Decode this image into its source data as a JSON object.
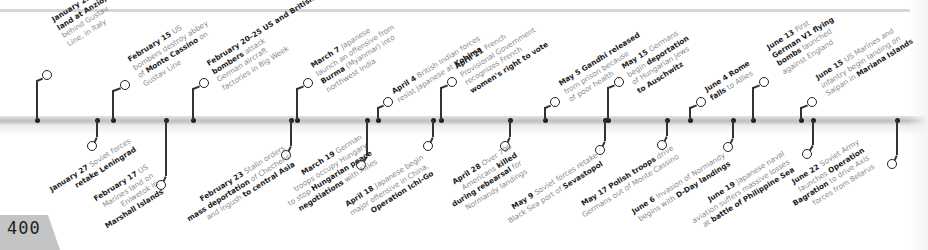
{
  "page_number": "400",
  "colors": {
    "band": "#c8c8c8",
    "marker": "#222222",
    "label_text": "#8a8a8a",
    "bold_text": "#1e1e1e",
    "page_tab": "#c4c4c4"
  },
  "events_top": [
    {
      "date": "January 22",
      "lines": [
        [
          [
            "Allied forces",
            0
          ]
        ],
        [
          [
            "land at Anzio,",
            1
          ]
        ],
        [
          [
            "behind Gustav",
            0
          ]
        ],
        [
          [
            "Line, in Italy",
            0
          ]
        ]
      ],
      "x": 37,
      "ring": [
        42,
        70
      ],
      "label": [
        50,
        16
      ]
    },
    {
      "date": "February 15",
      "lines": [
        [
          [
            "US",
            0
          ]
        ],
        [
          [
            "bombers destroy abbey",
            0
          ]
        ],
        [
          [
            "of ",
            0
          ],
          [
            "Monte Cassino",
            1
          ],
          [
            " on",
            0
          ]
        ],
        [
          [
            "Gustav Line",
            0
          ]
        ]
      ],
      "x": 113,
      "ring": [
        120,
        80
      ],
      "label": [
        126,
        56
      ]
    },
    {
      "date": "February 20–25",
      "lines": [
        [
          [
            "US and British",
            1
          ]
        ],
        [
          [
            "bombers",
            1
          ],
          [
            " attack",
            0
          ]
        ],
        [
          [
            "German aircraft",
            0
          ]
        ],
        [
          [
            "factories in Big Week",
            0
          ]
        ]
      ],
      "x": 193,
      "ring": [
        199,
        78
      ],
      "label": [
        205,
        60
      ]
    },
    {
      "date": "March 7",
      "lines": [
        [
          [
            "Japanese",
            0
          ]
        ],
        [
          [
            "launch an offensive from",
            0
          ]
        ],
        [
          [
            "Burma",
            1
          ],
          [
            " (Myanmar) into",
            0
          ]
        ],
        [
          [
            "northwest India",
            0
          ]
        ]
      ],
      "x": 297,
      "ring": [
        303,
        78
      ],
      "label": [
        309,
        62
      ]
    },
    {
      "date": "April 4",
      "lines": [
        [
          [
            "British Indian forces",
            0
          ]
        ],
        [
          [
            "resist Japanese at ",
            0
          ],
          [
            "Kohima",
            1
          ]
        ]
      ],
      "x": 378,
      "ring": [
        383,
        97
      ],
      "label": [
        390,
        88
      ]
    },
    {
      "date": "April 21",
      "lines": [
        [
          [
            "French",
            0
          ]
        ],
        [
          [
            "Provisional Government",
            0
          ]
        ],
        [
          [
            "recognizes French",
            0
          ]
        ],
        [
          [
            "women's right to vote",
            1
          ]
        ]
      ],
      "x": 441,
      "ring": [
        447,
        77
      ],
      "label": [
        453,
        63
      ]
    },
    {
      "date": "May 5",
      "lines": [
        [
          [
            "Gandhi released",
            1
          ]
        ],
        [
          [
            "from prison because",
            0
          ]
        ],
        [
          [
            "of poor health",
            0
          ]
        ]
      ],
      "x": 545,
      "ring": [
        550,
        97
      ],
      "label": [
        557,
        80
      ]
    },
    {
      "date": "May 15",
      "lines": [
        [
          [
            "Germans",
            0
          ]
        ],
        [
          [
            "begin ",
            0
          ],
          [
            "deportation",
            1
          ]
        ],
        [
          [
            "of Hungarian Jews",
            0
          ]
        ],
        [
          [
            "to Auschwitz",
            1
          ]
        ]
      ],
      "x": 608,
      "ring": [
        614,
        77
      ],
      "label": [
        620,
        63
      ]
    },
    {
      "date": "June 4",
      "lines": [
        [
          [
            "Rome",
            1
          ]
        ],
        [
          [
            "falls",
            1
          ],
          [
            " to Allies",
            0
          ]
        ]
      ],
      "x": 690,
      "ring": [
        696,
        97
      ],
      "label": [
        703,
        86
      ]
    },
    {
      "date": "June 13",
      "lines": [
        [
          [
            "First",
            0
          ]
        ],
        [
          [
            "German V1 flying",
            1
          ]
        ],
        [
          [
            "bombs",
            1
          ],
          [
            " launched",
            0
          ]
        ],
        [
          [
            "against England",
            0
          ]
        ]
      ],
      "x": 753,
      "ring": [
        759,
        77
      ],
      "label": [
        765,
        44
      ]
    },
    {
      "date": "June 15",
      "lines": [
        [
          [
            "US Marines and",
            0
          ]
        ],
        [
          [
            "infantry begin landing on",
            0
          ]
        ],
        [
          [
            "Saipan in ",
            0
          ],
          [
            "Mariana Islands",
            1
          ]
        ]
      ],
      "x": 801,
      "ring": [
        807,
        97
      ],
      "label": [
        814,
        74
      ]
    }
  ],
  "events_bottom": [
    {
      "date": "January 27",
      "lines": [
        [
          [
            "Soviet forces",
            0
          ]
        ],
        [
          [
            "retake Leningrad",
            1
          ]
        ]
      ],
      "x": 97,
      "ring": [
        87,
        141
      ],
      "label": [
        48,
        186
      ]
    },
    {
      "date": "February 17",
      "lines": [
        [
          [
            "US",
            0
          ]
        ],
        [
          [
            "Marines land on",
            0
          ]
        ],
        [
          [
            "Eniwetok in",
            0
          ]
        ],
        [
          [
            "Marshall Islands",
            1
          ]
        ]
      ],
      "x": 166,
      "ring": [
        156,
        180
      ],
      "label": [
        88,
        198
      ]
    },
    {
      "date": "February 23",
      "lines": [
        [
          [
            "Stalin orders",
            0
          ]
        ],
        [
          [
            "mass deportation",
            1
          ],
          [
            " of Chechens",
            0
          ]
        ],
        [
          [
            "and Ingush ",
            0
          ],
          [
            "to central Asia",
            1
          ]
        ]
      ],
      "x": 291,
      "ring": [
        281,
        150
      ],
      "label": [
        180,
        207
      ]
    },
    {
      "date": "March 19",
      "lines": [
        [
          [
            "German",
            0
          ]
        ],
        [
          [
            "troops occupy Hungary",
            0
          ]
        ],
        [
          [
            "to stop ",
            0
          ],
          [
            "Hungarian peace",
            1
          ]
        ],
        [
          [
            "negotiations",
            1
          ],
          [
            " with Allies",
            0
          ]
        ]
      ],
      "x": 367,
      "ring": [
        356,
        160
      ],
      "label": [
        276,
        184
      ]
    },
    {
      "date": "April 18",
      "lines": [
        [
          [
            "Japanese begin",
            0
          ]
        ],
        [
          [
            "major offensive in China,",
            0
          ]
        ],
        [
          [
            "Operation Ichi-Go",
            1
          ]
        ]
      ],
      "x": 433,
      "ring": [
        423,
        141
      ],
      "label": [
        343,
        201
      ]
    },
    {
      "date": "April 28",
      "lines": [
        [
          [
            "Over 700",
            0
          ]
        ],
        [
          [
            "Americans ",
            0
          ],
          [
            "killed",
            1
          ]
        ],
        [
          [
            "during rebearsal",
            1
          ],
          [
            " for",
            0
          ]
        ],
        [
          [
            "Normandy landings",
            0
          ]
        ]
      ],
      "x": 510,
      "ring": [
        500,
        141
      ],
      "label": [
        440,
        185
      ]
    },
    {
      "date": "May 9",
      "lines": [
        [
          [
            "Soviet forces retake",
            0
          ]
        ],
        [
          [
            "Black Sea port of ",
            0
          ],
          [
            "Sevastopol",
            1
          ]
        ]
      ],
      "x": 605,
      "ring": [
        595,
        145
      ],
      "label": [
        501,
        209
      ]
    },
    {
      "date": "May 17",
      "lines": [
        [
          [
            "Polish troops",
            1
          ],
          [
            " drive",
            0
          ]
        ],
        [
          [
            "Germans out of Monte Cassino",
            0
          ]
        ]
      ],
      "x": 667,
      "ring": [
        657,
        140
      ],
      "label": [
        575,
        203
      ]
    },
    {
      "date": "June 6",
      "lines": [
        [
          [
            "Invasion of Normandy",
            0
          ]
        ],
        [
          [
            "begins with ",
            0
          ],
          [
            "D-Day landings",
            1
          ]
        ]
      ],
      "x": 733,
      "ring": [
        723,
        142
      ],
      "label": [
        630,
        208
      ]
    },
    {
      "date": "June 19",
      "lines": [
        [
          [
            "Japanese naval",
            0
          ]
        ],
        [
          [
            "aviation suffers massive losses",
            0
          ]
        ],
        [
          [
            "at ",
            0
          ],
          [
            "battle of Philippine Sea",
            1
          ]
        ]
      ],
      "x": 813,
      "ring": [
        802,
        149
      ],
      "label": [
        685,
        209
      ]
    },
    {
      "date": "June 22",
      "lines": [
        [
          [
            "Soviet Army",
            0
          ]
        ],
        [
          [
            "launches ",
            0
          ],
          [
            "Operation",
            1
          ]
        ],
        [
          [
            "Bagration",
            1
          ],
          [
            " to drive Axis",
            0
          ]
        ],
        [
          [
            "forces from Belarus",
            0
          ]
        ]
      ],
      "x": 897,
      "ring": [
        887,
        159
      ],
      "label": [
        781,
        184
      ]
    }
  ]
}
